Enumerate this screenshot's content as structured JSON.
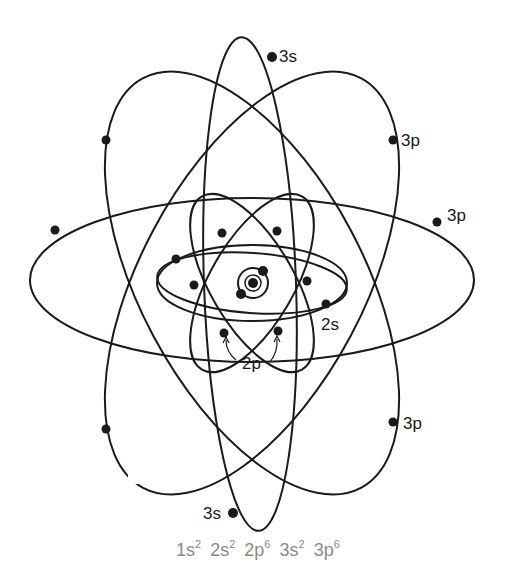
{
  "diagram": {
    "nucleus": {
      "x": 253,
      "y": 283,
      "r": 5
    },
    "shells": {
      "1s": {
        "electrons": 2
      },
      "2s": {
        "label": "2s",
        "electrons": 2
      },
      "2p": {
        "label": "2p",
        "electrons": 6
      },
      "3s": {
        "label": "3s",
        "electrons": 2
      },
      "3p": {
        "label": "3p",
        "electrons": 6
      }
    },
    "labels": [
      {
        "id": "3s-top",
        "text": "3s",
        "x": 279,
        "y": 46
      },
      {
        "id": "3p-upper-right",
        "text": "3p",
        "x": 401,
        "y": 130
      },
      {
        "id": "3p-right",
        "text": "3p",
        "x": 447,
        "y": 205
      },
      {
        "id": "2s",
        "text": "2s",
        "x": 321,
        "y": 314
      },
      {
        "id": "2p",
        "text": "2p",
        "x": 242,
        "y": 353
      },
      {
        "id": "3p-lower-right",
        "text": "3p",
        "x": 403,
        "y": 413
      },
      {
        "id": "3s-bottom",
        "text": "3s",
        "x": 203,
        "y": 503
      }
    ],
    "configuration": {
      "terms": [
        {
          "base": "1s",
          "sup": "2"
        },
        {
          "base": "2s",
          "sup": "2"
        },
        {
          "base": "2p",
          "sup": "6"
        },
        {
          "base": "3s",
          "sup": "2"
        },
        {
          "base": "3p",
          "sup": "6"
        }
      ]
    },
    "colors": {
      "ink": "#1a1a1a",
      "config_text": "#8a8a8a",
      "background": "#ffffff"
    }
  }
}
